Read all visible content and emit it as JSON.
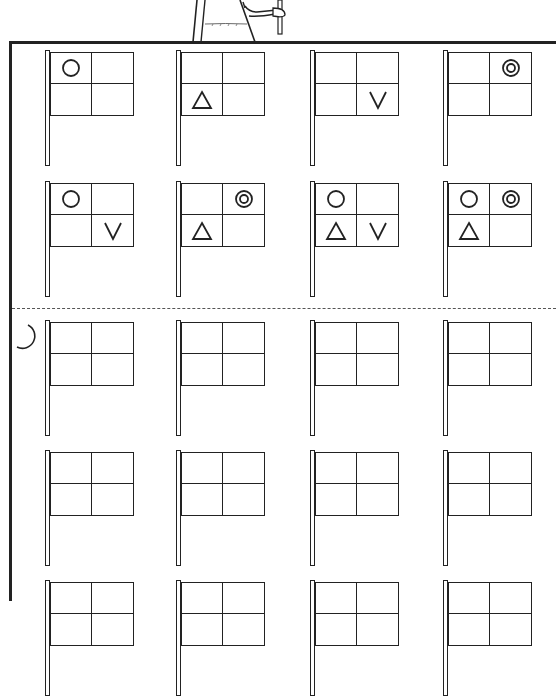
{
  "worksheet": {
    "colors": {
      "line": "#222222",
      "background": "#ffffff"
    },
    "section_marker_icon": "crescent-moon-icon",
    "grid": {
      "columns": [
        45,
        176,
        310,
        443
      ],
      "rows": [
        50,
        181,
        320,
        450,
        580
      ]
    },
    "flags": [
      {
        "row": 0,
        "col": 0,
        "cells": [
          "circle",
          "",
          "",
          ""
        ]
      },
      {
        "row": 0,
        "col": 1,
        "cells": [
          "",
          "",
          "triangle",
          ""
        ]
      },
      {
        "row": 0,
        "col": 2,
        "cells": [
          "",
          "",
          "",
          "v"
        ]
      },
      {
        "row": 0,
        "col": 3,
        "cells": [
          "",
          "double-circle",
          "",
          ""
        ]
      },
      {
        "row": 1,
        "col": 0,
        "cells": [
          "circle",
          "",
          "",
          "v"
        ]
      },
      {
        "row": 1,
        "col": 1,
        "cells": [
          "",
          "double-circle",
          "triangle",
          ""
        ]
      },
      {
        "row": 1,
        "col": 2,
        "cells": [
          "circle",
          "",
          "triangle",
          "v"
        ]
      },
      {
        "row": 1,
        "col": 3,
        "cells": [
          "circle",
          "double-circle",
          "triangle",
          ""
        ]
      },
      {
        "row": 2,
        "col": 0,
        "cells": [
          "",
          "",
          "",
          ""
        ]
      },
      {
        "row": 2,
        "col": 1,
        "cells": [
          "",
          "",
          "",
          ""
        ]
      },
      {
        "row": 2,
        "col": 2,
        "cells": [
          "",
          "",
          "",
          ""
        ]
      },
      {
        "row": 2,
        "col": 3,
        "cells": [
          "",
          "",
          "",
          ""
        ]
      },
      {
        "row": 3,
        "col": 0,
        "cells": [
          "",
          "",
          "",
          ""
        ]
      },
      {
        "row": 3,
        "col": 1,
        "cells": [
          "",
          "",
          "",
          ""
        ]
      },
      {
        "row": 3,
        "col": 2,
        "cells": [
          "",
          "",
          "",
          ""
        ]
      },
      {
        "row": 3,
        "col": 3,
        "cells": [
          "",
          "",
          "",
          ""
        ]
      },
      {
        "row": 4,
        "col": 0,
        "cells": [
          "",
          "",
          "",
          ""
        ]
      },
      {
        "row": 4,
        "col": 1,
        "cells": [
          "",
          "",
          "",
          ""
        ]
      },
      {
        "row": 4,
        "col": 2,
        "cells": [
          "",
          "",
          "",
          ""
        ]
      },
      {
        "row": 4,
        "col": 3,
        "cells": [
          "",
          "",
          "",
          ""
        ]
      }
    ]
  }
}
